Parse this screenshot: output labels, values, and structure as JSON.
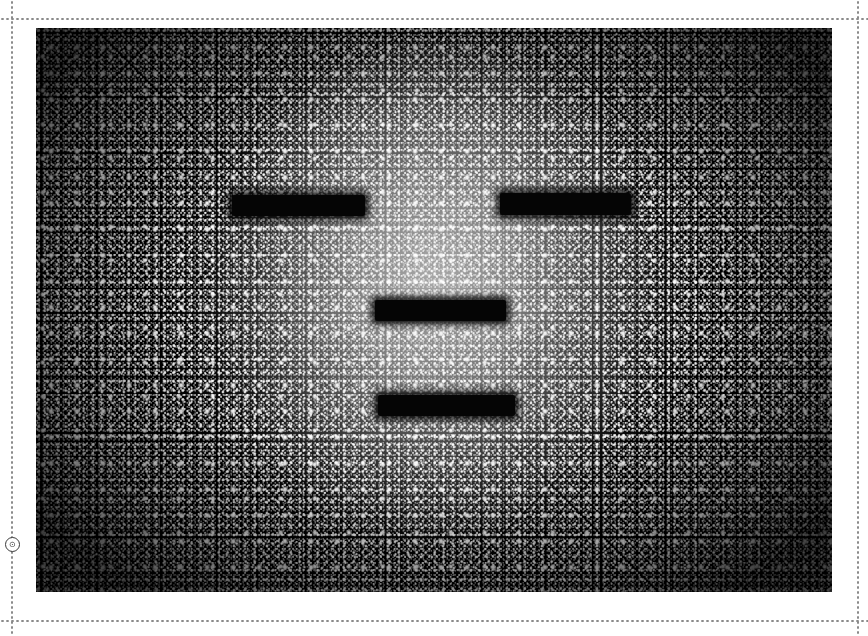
{
  "page": {
    "background_color": "#ffffff",
    "width": 868,
    "height": 636
  },
  "guides": {
    "color": "#8a8a8a",
    "style": "dotted",
    "top_label": "top-margin-guide",
    "bottom_label": "bottom-margin-guide",
    "left_label": "left-margin-guide",
    "right_label": "right-margin-guide"
  },
  "marker": {
    "glyph": "⊙",
    "name": "origin-marker-icon"
  },
  "artwork": {
    "title": "condensation-face-photograph",
    "background_color": "#000000",
    "highlight_color": "#ffffff",
    "subject": "face formed in condensation droplets",
    "censor_bars": [
      {
        "name": "left-eye-bar",
        "left": 196,
        "top": 167,
        "width": 133,
        "height": 21
      },
      {
        "name": "right-eye-bar",
        "left": 464,
        "top": 165,
        "width": 131,
        "height": 22
      },
      {
        "name": "nose-bar",
        "left": 339,
        "top": 272,
        "width": 131,
        "height": 21
      },
      {
        "name": "mouth-bar",
        "left": 342,
        "top": 367,
        "width": 137,
        "height": 21
      }
    ]
  },
  "caption": {
    "text": "He is here",
    "color": "#ffffff",
    "orientation": "vertical"
  }
}
